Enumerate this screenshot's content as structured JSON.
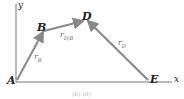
{
  "diagram": {
    "points": {
      "A": "A",
      "B": "B",
      "D": "D",
      "E": "E"
    },
    "axes": {
      "x": "x",
      "y": "y"
    },
    "vectors": {
      "rB": "r",
      "rB_sub": "B",
      "rDB": "r",
      "rDB_sub": "D/B",
      "rD": "r",
      "rD_sub": "D"
    },
    "caption": "(b) (d)",
    "colors": {
      "vector": "#888888",
      "axis": "#777777"
    }
  }
}
